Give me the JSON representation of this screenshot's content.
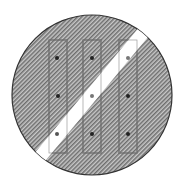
{
  "sign": {
    "type": "end-of-restriction-road-sign",
    "colors": {
      "background": "#ffffff",
      "hatch_dark": "#6e6e6e",
      "hatch_light": "#c8c8c8",
      "outline": "#333333",
      "stripe": "#ffffff",
      "dot": "#222222"
    },
    "circle": {
      "cx": 92,
      "cy": 95,
      "r": 80
    },
    "bars": [
      {
        "x": 49,
        "y": 40,
        "w": 18,
        "h": 113,
        "dots_y": [
          58,
          96,
          135
        ],
        "dot_x": 57
      },
      {
        "x": 83,
        "y": 40,
        "w": 18,
        "h": 113,
        "dots_y": [
          58,
          96,
          135
        ],
        "dot_x": 92
      },
      {
        "x": 119,
        "y": 40,
        "w": 18,
        "h": 113,
        "dots_y": [
          58,
          96,
          135
        ],
        "dot_x": 128
      }
    ],
    "stripe": {
      "x1": 44,
      "y1": 152,
      "x2": 142,
      "y2": 34,
      "width": 13
    }
  }
}
